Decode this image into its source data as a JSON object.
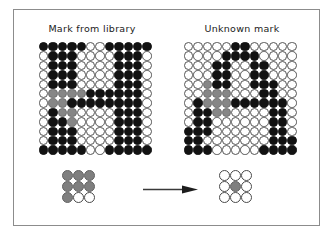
{
  "figure": {
    "panels": [
      {
        "id": "library-mark",
        "title": "Mark from library",
        "letter": "H"
      },
      {
        "id": "unknown-mark",
        "title": "Unknown mark",
        "letter": "A"
      }
    ],
    "colors": {
      "bead_black": "#121212",
      "bead_gray": "#868686",
      "bead_white": "#ffffff",
      "bead_outline": "#4a4a4a",
      "frame_border": "#8c8c8c",
      "arrow": "#3a3a3a",
      "text": "#1a1a1a"
    },
    "arrow": {
      "name": "right-arrow",
      "direction": "right"
    },
    "grid_size": {
      "cols": 12,
      "rows": 12
    },
    "patch_size": {
      "cols": 3,
      "rows": 3
    },
    "legend": {
      "b": "black bead",
      "g": "gray bead (matched region)",
      "w": "white bead"
    }
  },
  "chart_data": {
    "type": "heatmap",
    "title": "",
    "grids": {
      "library_mark": {
        "label": "Mark from library",
        "cols": 12,
        "rows": 12,
        "cells": [
          "bbbbbwwbbbbb",
          "wbbbwwwwbbbw",
          "wbbbwwwwbbbw",
          "wbbbwwwwbbbw",
          "wbbbwwwwbbbw",
          "wggggbbbbbbw",
          "wggbbbbbbbbw",
          "wbggwwwwbbbw",
          "wbbgwwwwbbbw",
          "wbbbwwwwbbbw",
          "wbbbwwwwbbbw",
          "bbbbbwwbbbbb"
        ]
      },
      "unknown_mark": {
        "label": "Unknown mark",
        "cols": 12,
        "rows": 12,
        "cells": [
          "wwwwwbbwwwww",
          "wwwwbbbbwwww",
          "wwwbbwwbbwww",
          "wwwbbwwbbwww",
          "wwgbbwwbbbww",
          "wwgggwwwbbww",
          "wbgggbbbbbbw",
          "wbbggwwwwbbw",
          "wbbwwwwwwbbw",
          "bbbwwwwwwbbw",
          "bbwwwwwwwbbb",
          "bbbwwwwwbbbb"
        ]
      },
      "source_patch": {
        "label": "source patch",
        "cols": 3,
        "rows": 3,
        "cells": [
          "ggg",
          "ggg",
          "gww"
        ]
      },
      "target_patch": {
        "label": "target patch",
        "cols": 3,
        "rows": 3,
        "cells": [
          "www",
          "wgw",
          "www"
        ]
      }
    }
  }
}
